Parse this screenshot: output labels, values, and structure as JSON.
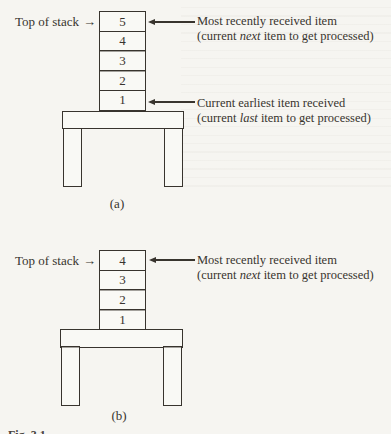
{
  "figure": {
    "glyphs": {
      "right_arrow": "→"
    },
    "caption_cutoff": "Fig. 3.1",
    "colors": {
      "ink": "#38342e",
      "paper": "#f6f5f1"
    }
  },
  "diagram_a": {
    "panel_label": "(a)",
    "top_of_stack": "Top of stack",
    "cells": [
      "5",
      "4",
      "3",
      "2",
      "1"
    ],
    "note_top": {
      "line1": "Most recently received item",
      "line2_prefix": "(current ",
      "line2_em": "next",
      "line2_suffix": " item to get processed)"
    },
    "note_bottom": {
      "line1": "Current earliest item received",
      "line2_prefix": "(current ",
      "line2_em": "last",
      "line2_suffix": " item to get processed)"
    }
  },
  "diagram_b": {
    "panel_label": "(b)",
    "top_of_stack": "Top of stack",
    "cells": [
      "4",
      "3",
      "2",
      "1"
    ],
    "note_top": {
      "line1": "Most recently received item",
      "line2_prefix": "(current ",
      "line2_em": "next",
      "line2_suffix": " item to get processed)"
    }
  }
}
